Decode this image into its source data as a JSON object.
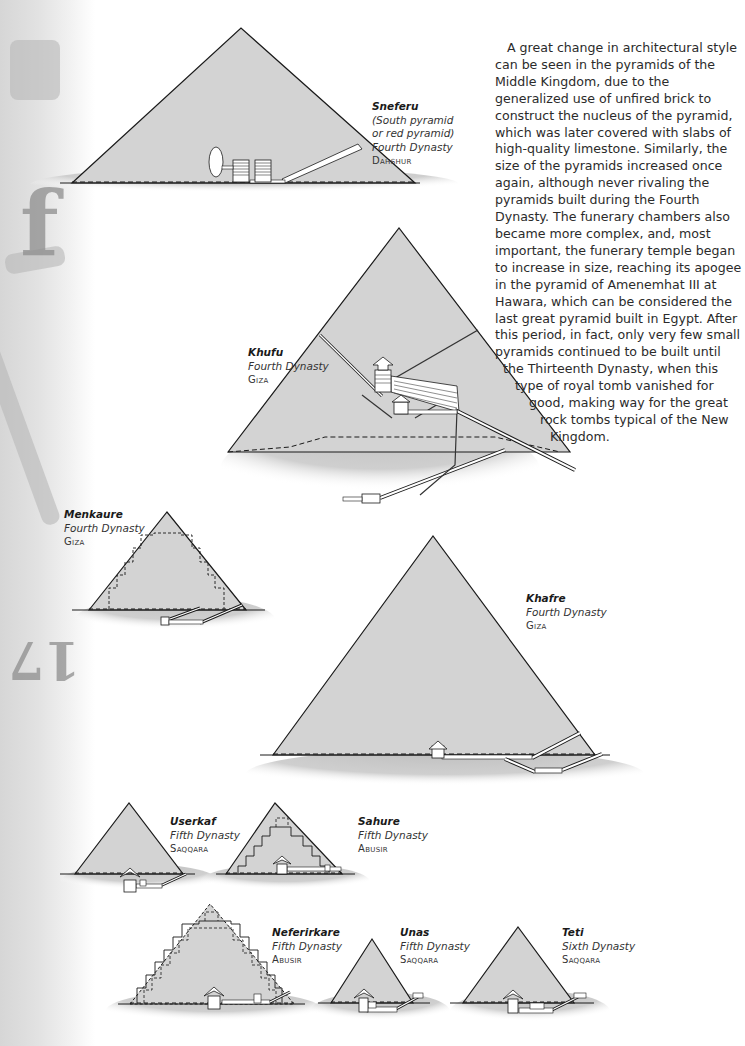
{
  "page": {
    "side_decoration": {
      "glyph_top": "f",
      "glyph_bottom": "17"
    }
  },
  "body_text": {
    "lines": [
      "A great change in architectural style",
      "can be seen in the pyramids of the",
      "Middle Kingdom, due to the",
      "generalized use of unfired brick to",
      "construct the nucleus of the pyramid,",
      "which was later covered with slabs of",
      "high-quality limestone. Similarly, the",
      "size of the pyramids increased once",
      "again, although never rivaling the",
      "pyramids built during the Fourth",
      "Dynasty. The funerary chambers also",
      "became more complex, and, most",
      "important, the funerary temple began",
      "to increase in size, reaching its apogee",
      "in the pyramid of Amenemhat III at",
      "Hawara, which can be considered the",
      "last great pyramid built in Egypt. After",
      "this period, in fact, only very few small",
      "pyramids continued to be built until",
      "the Thirteenth Dynasty, when this",
      "type of royal tomb vanished for",
      "good, making way for the great",
      "rock tombs typical of the New",
      "Kingdom."
    ]
  },
  "pyramids": [
    {
      "name": "Sneferu",
      "note1": "(South pyramid",
      "note2": "or red pyramid)",
      "dynasty": "Fourth Dynasty",
      "site": "Dahshur"
    },
    {
      "name": "Khufu",
      "dynasty": "Fourth Dynasty",
      "site": "Giza"
    },
    {
      "name": "Menkaure",
      "dynasty": "Fourth Dynasty",
      "site": "Giza"
    },
    {
      "name": "Khafre",
      "dynasty": "Fourth Dynasty",
      "site": "Giza"
    },
    {
      "name": "Userkaf",
      "dynasty": "Fifth Dynasty",
      "site": "Saqqara"
    },
    {
      "name": "Sahure",
      "dynasty": "Fifth Dynasty",
      "site": "Abusir"
    },
    {
      "name": "Neferirkare",
      "dynasty": "Fifth Dynasty",
      "site": "Abusir"
    },
    {
      "name": "Unas",
      "dynasty": "Fifth Dynasty",
      "site": "Saqqara"
    },
    {
      "name": "Teti",
      "dynasty": "Sixth Dynasty",
      "site": "Saqqara"
    }
  ],
  "colors": {
    "pyramid_fill": "#d3d3d3",
    "ground_fill": "#c4c4c4",
    "outline": "#1a1a1a",
    "text": "#2b2b2b"
  }
}
